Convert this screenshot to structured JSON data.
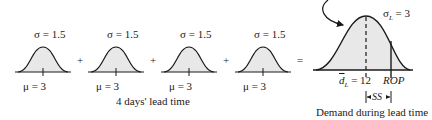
{
  "diagram": {
    "small_distributions": [
      {
        "sigma_label": "σ = 1.5",
        "mu_label": "μ = 3",
        "center_x": 43
      },
      {
        "sigma_label": "σ = 1.5",
        "mu_label": "μ = 3",
        "center_x": 116
      },
      {
        "sigma_label": "σ = 1.5",
        "mu_label": "μ = 3",
        "center_x": 189
      },
      {
        "sigma_label": "σ = 1.5",
        "mu_label": "μ = 3",
        "center_x": 263
      }
    ],
    "operators": {
      "plus": "+",
      "equals": "="
    },
    "small_caption": "4 days' lead time",
    "result_distribution": {
      "sigma_label_prefix": "σ",
      "sigma_label_sub": "L",
      "sigma_label_value": " = 3",
      "mean_label_symbol": "d",
      "mean_label_sub": "L",
      "mean_label_value": " = 12",
      "rop_label": "ROP",
      "ss_label": "SS",
      "caption": "Demand during lead time"
    },
    "colors": {
      "fill": "#e8e8e8",
      "stroke": "#1a1a1a"
    }
  }
}
